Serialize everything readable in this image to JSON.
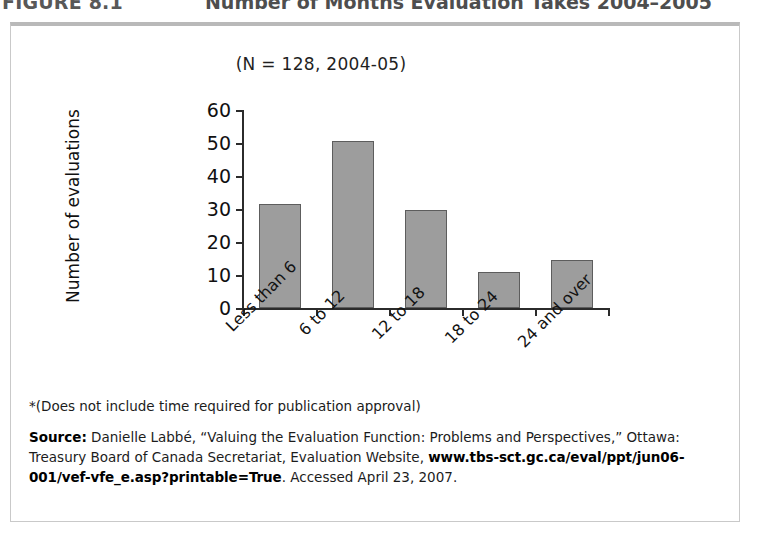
{
  "figure": {
    "number": "FIGURE 8.1",
    "title": "Number of Months Evaluation Takes 2004–2005"
  },
  "chart_data": {
    "type": "bar",
    "title": "Number of Months Evaluation Takes 2004–2005",
    "subtitle": "(N = 128, 2004-05)",
    "categories": [
      "Less than 6",
      "6 to 12",
      "12 to 18",
      "18 to 24",
      "24 and over"
    ],
    "values": [
      31.5,
      50.5,
      29.8,
      10.8,
      14.5
    ],
    "xlabel": "",
    "ylabel": "Number of evaluations",
    "ylim": [
      0,
      60
    ],
    "yticks": [
      0,
      10,
      20,
      30,
      40,
      50,
      60
    ],
    "ytick_labels": [
      "0",
      "10",
      "20",
      "30",
      "40",
      "50",
      "60"
    ],
    "grid": false,
    "legend": false,
    "bar_color": "#9d9d9d",
    "bar_edge_color": "#5d5d5d",
    "axis_color": "#2b2b2b"
  },
  "notes": {
    "footnote": "*(Does not include time required for publication approval)",
    "source_label": "Source:",
    "source_part1": " Danielle Labbé, “Valuing the Evaluation Function: Problems and Perspectives,” Ottawa: Treasury Board of Canada Secretariat, Evaluation Website, ",
    "source_url": "www.tbs-sct.gc.ca/eval/ppt/jun06-001/vef-vfe_e.asp?printable=True",
    "source_part2": ". Accessed April 23, 2007."
  }
}
